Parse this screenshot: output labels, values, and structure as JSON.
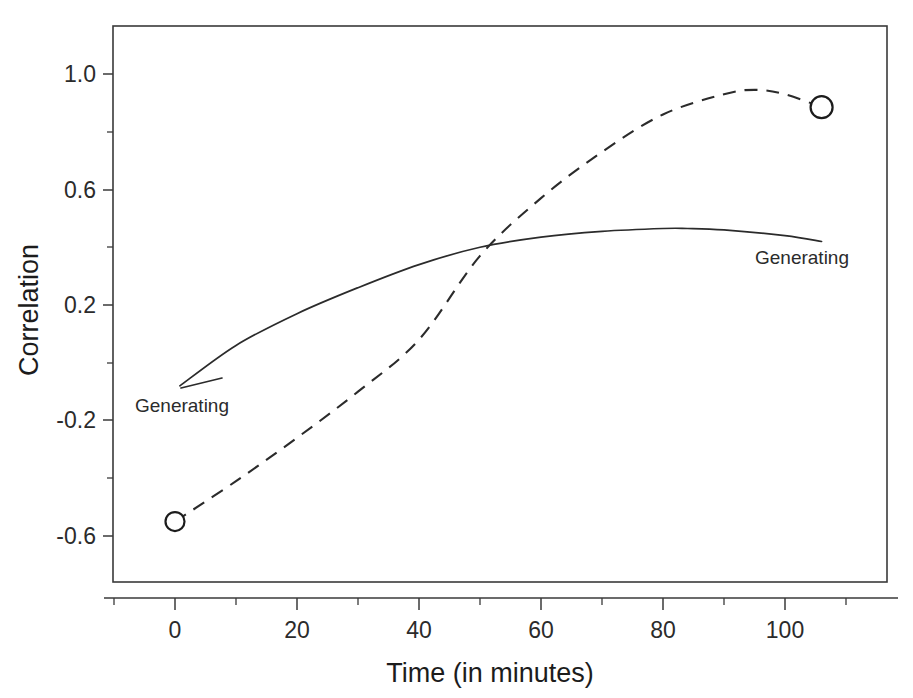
{
  "chart_data": {
    "type": "line",
    "title": "",
    "xlabel": "Time (in minutes)",
    "ylabel": "Correlation",
    "xlim": [
      -10,
      117
    ],
    "ylim": [
      -0.78,
      1.12
    ],
    "grid": false,
    "legend_position": "inline-annotations",
    "x_ticks": [
      0,
      20,
      40,
      60,
      80,
      100
    ],
    "x_tick_labels": [
      "0",
      "20",
      "40",
      "60",
      "80",
      "100"
    ],
    "x_minor_ticks": [
      10,
      30,
      50,
      70,
      90,
      110
    ],
    "y_ticks": [
      1.0,
      0.6,
      0.2,
      -0.2,
      -0.6
    ],
    "y_tick_labels": [
      "1.0",
      "0.6",
      "0.2",
      "-0.2",
      "-0.6"
    ],
    "y_minor_ticks": [
      0.8,
      0.4,
      0.0,
      -0.4
    ],
    "series": [
      {
        "name": "Generating",
        "style": "solid",
        "label_text": "Generating",
        "label_x": 8,
        "label_y": -0.16,
        "markers": [],
        "x": [
          0.8,
          10,
          20,
          30,
          40,
          50,
          60,
          70,
          80,
          84,
          90,
          100,
          106
        ],
        "values": [
          -0.08,
          0.06,
          0.17,
          0.26,
          0.34,
          0.4,
          0.435,
          0.455,
          0.465,
          0.465,
          0.46,
          0.44,
          0.42
        ]
      },
      {
        "name": "Generating",
        "style": "dashed",
        "label_text": "Generating",
        "label_x": 95,
        "label_y": 0.33,
        "markers": [
          {
            "x": 0,
            "y": -0.55
          },
          {
            "x": 106,
            "y": 0.885
          }
        ],
        "x": [
          0,
          10,
          20,
          30,
          40,
          50,
          60,
          70,
          80,
          90,
          95,
          100,
          106
        ],
        "values": [
          -0.55,
          -0.41,
          -0.26,
          -0.1,
          0.08,
          0.37,
          0.57,
          0.73,
          0.86,
          0.93,
          0.945,
          0.93,
          0.885
        ]
      }
    ],
    "annotations": [
      {
        "text": "Generating",
        "series": "solid"
      },
      {
        "text": "Generating",
        "series": "dashed"
      }
    ]
  },
  "axes": {
    "y_title": "Correlation",
    "x_title": "Time (in minutes)"
  }
}
